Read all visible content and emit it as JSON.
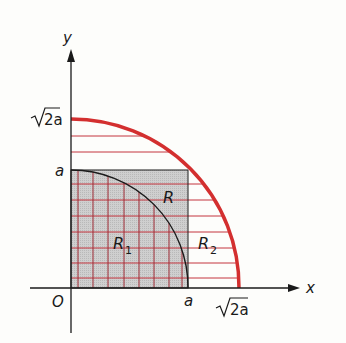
{
  "diagram": {
    "axes": {
      "x_label": "x",
      "y_label": "y",
      "origin_label": "O"
    },
    "tick_labels": {
      "y_a": "a",
      "y_sqrt2a_radical": "√",
      "y_sqrt2a_body": "2a",
      "x_a": "a",
      "x_sqrt2a_radical": "√",
      "x_sqrt2a_body": "2a"
    },
    "region_labels": {
      "R": "R",
      "R1_main": "R",
      "R1_sub": "1",
      "R2_main": "R",
      "R2_sub": "2"
    },
    "colors": {
      "background": "#fdfdfb",
      "square_fill": "#c9c9c9",
      "grid_red": "#b8343c",
      "arc_red": "#d32f2f",
      "axis": "#1a1a1a"
    }
  }
}
